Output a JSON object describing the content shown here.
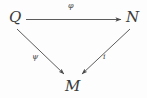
{
  "diagram": {
    "kind": "commutative-triangle",
    "background_color": "#fdfdfd",
    "stroke_color": "#4a4a4a",
    "text_color": "#3a3a3a",
    "nodes": [
      {
        "id": "Q",
        "label": "Q",
        "x": 16,
        "y": 19
      },
      {
        "id": "N",
        "label": "N",
        "x": 131,
        "y": 19
      },
      {
        "id": "M",
        "label": "M",
        "x": 72,
        "y": 87
      }
    ],
    "arrows": [
      {
        "id": "q-to-n",
        "from": "Q",
        "to": "N",
        "label": "φ",
        "direction": "right"
      },
      {
        "id": "q-to-m",
        "from": "Q",
        "to": "M",
        "label": "ψ",
        "direction": "down-right"
      },
      {
        "id": "n-to-m",
        "from": "N",
        "to": "M",
        "label": "i",
        "direction": "down-left"
      }
    ]
  }
}
